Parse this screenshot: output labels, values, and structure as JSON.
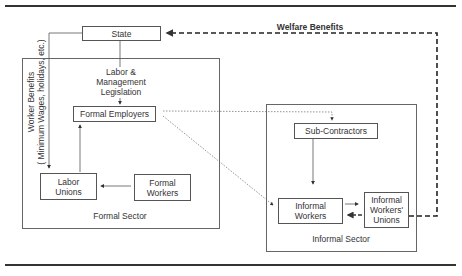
{
  "diagram": {
    "nodes": {
      "state": "State",
      "legislation_line1": "Labor &",
      "legislation_line2": "Management",
      "legislation_line3": "Legislation",
      "formal_employers": "Formal Employers",
      "labor_unions_line1": "Labor",
      "labor_unions_line2": "Unions",
      "formal_workers_line1": "Formal",
      "formal_workers_line2": "Workers",
      "sub_contractors": "Sub-Contractors",
      "informal_workers_line1": "Informal",
      "informal_workers_line2": "Workers",
      "informal_unions_line1": "Informal",
      "informal_unions_line2": "Workers'",
      "informal_unions_line3": "Unions"
    },
    "groups": {
      "formal_sector": "Formal Sector",
      "informal_sector": "Informal Sector"
    },
    "edge_labels": {
      "welfare_benefits": "Welfare Benefits",
      "worker_benefits_line1": "Worker Benefits",
      "worker_benefits_line2": "( Minimum Wages, holidays, etc.)"
    },
    "edges": [
      {
        "from": "State",
        "to": "Formal Employers",
        "style": "solid",
        "label": "Labor & Management Legislation"
      },
      {
        "from": "State",
        "to": "Labor Unions",
        "style": "solid",
        "label": "Worker Benefits (Minimum Wages, holidays, etc.)"
      },
      {
        "from": "Labor Unions",
        "to": "Formal Employers",
        "style": "solid"
      },
      {
        "from": "Formal Workers",
        "to": "Labor Unions",
        "style": "solid"
      },
      {
        "from": "Formal Employers",
        "to": "Sub-Contractors",
        "style": "dotted"
      },
      {
        "from": "Formal Employers",
        "to": "Informal Workers",
        "style": "dotted"
      },
      {
        "from": "Sub-Contractors",
        "to": "Informal Workers",
        "style": "solid"
      },
      {
        "from": "Informal Workers",
        "to": "Informal Workers' Unions",
        "style": "solid"
      },
      {
        "from": "Informal Workers' Unions",
        "to": "Informal Workers",
        "style": "dashed"
      },
      {
        "from": "Informal Workers' Unions",
        "to": "State",
        "style": "dashed-bold",
        "label": "Welfare Benefits"
      }
    ]
  }
}
